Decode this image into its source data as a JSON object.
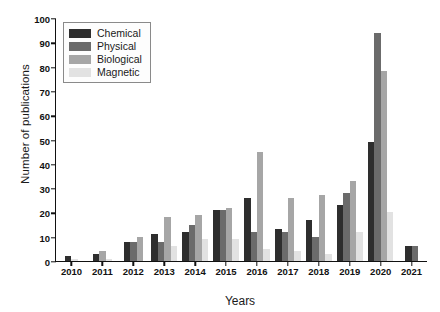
{
  "chart_data": {
    "type": "bar",
    "title": "",
    "xlabel": "Years",
    "ylabel": "Number of publications",
    "categories": [
      "2010",
      "2011",
      "2012",
      "2013",
      "2014",
      "2015",
      "2016",
      "2017",
      "2018",
      "2019",
      "2020",
      "2021"
    ],
    "series": [
      {
        "name": "Chemical",
        "color": "#2e2e2e",
        "values": [
          2,
          3,
          8,
          11,
          12,
          21,
          26,
          13,
          17,
          23,
          49,
          6
        ]
      },
      {
        "name": "Physical",
        "color": "#6b6b6b",
        "values": [
          0,
          0,
          8,
          8,
          15,
          21,
          12,
          12,
          10,
          28,
          94,
          6
        ]
      },
      {
        "name": "Biological",
        "color": "#a6a6a6",
        "values": [
          0,
          4,
          10,
          18,
          19,
          22,
          45,
          26,
          27,
          33,
          78,
          0
        ]
      },
      {
        "name": "Magnetic",
        "color": "#e2e2e2",
        "values": [
          1,
          1,
          0,
          6,
          9,
          9,
          5,
          4,
          3,
          12,
          20,
          0
        ]
      }
    ],
    "ylim": [
      0,
      100
    ],
    "yticks": [
      0,
      10,
      20,
      30,
      40,
      50,
      60,
      70,
      80,
      90,
      100
    ],
    "grid": false,
    "legend_position": "upper-left",
    "legend_entries": [
      "Chemical",
      "Physical",
      "Biological",
      "Magnetic"
    ]
  }
}
